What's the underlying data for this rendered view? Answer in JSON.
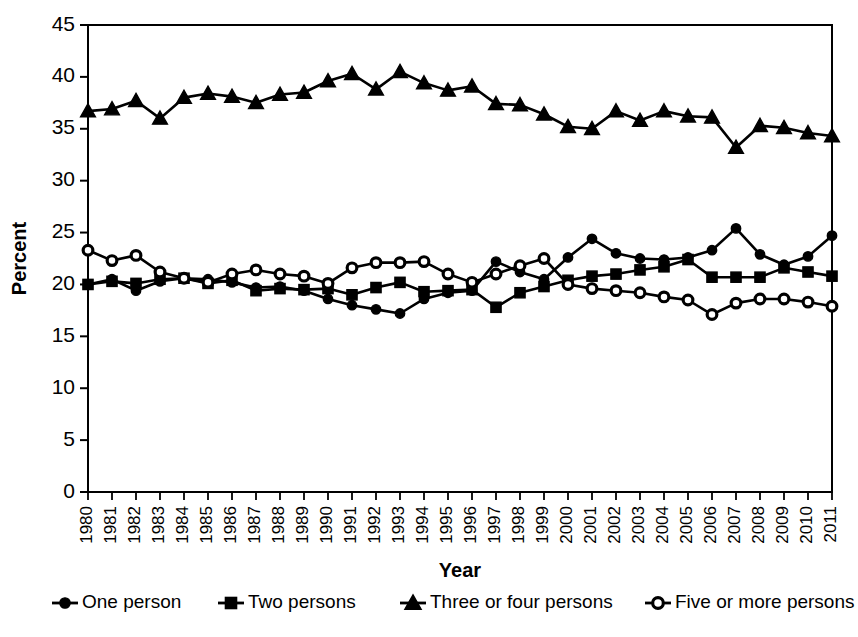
{
  "figure": {
    "background": "#ffffff",
    "ink": "#000000"
  },
  "axes": {
    "xlabel": "Year",
    "ylabel": "Percent",
    "y_ticks": [
      "0",
      "5",
      "10",
      "15",
      "20",
      "25",
      "30",
      "35",
      "40",
      "45"
    ]
  },
  "legend": {
    "items": [
      {
        "label": "One person",
        "marker": "filled-circle"
      },
      {
        "label": "Two persons",
        "marker": "filled-square"
      },
      {
        "label": "Three or four persons",
        "marker": "filled-triangle"
      },
      {
        "label": "Five or more persons",
        "marker": "open-circle"
      }
    ]
  },
  "chart_data": {
    "type": "line",
    "title": "",
    "subtitle": "",
    "xlabel": "Year",
    "ylabel": "Percent",
    "xlim": [
      1980,
      2011
    ],
    "ylim": [
      0,
      45
    ],
    "ytick_interval": 5,
    "grid": false,
    "legend_position": "bottom",
    "x": [
      1980,
      1981,
      1982,
      1983,
      1984,
      1985,
      1986,
      1987,
      1988,
      1989,
      1990,
      1991,
      1992,
      1993,
      1994,
      1995,
      1996,
      1997,
      1998,
      1999,
      2000,
      2001,
      2002,
      2003,
      2004,
      2005,
      2006,
      2007,
      2008,
      2009,
      2010,
      2011
    ],
    "categories": [
      "1980",
      "1981",
      "1982",
      "1983",
      "1984",
      "1985",
      "1986",
      "1987",
      "1988",
      "1989",
      "1990",
      "1991",
      "1992",
      "1993",
      "1994",
      "1995",
      "1996",
      "1997",
      "1998",
      "1999",
      "2000",
      "2001",
      "2002",
      "2003",
      "2004",
      "2005",
      "2006",
      "2007",
      "2008",
      "2009",
      "2010",
      "2011"
    ],
    "series": [
      {
        "name": "One person",
        "marker": "filled-circle",
        "color": "#000000",
        "values": [
          20.0,
          20.5,
          19.4,
          20.3,
          20.6,
          20.5,
          20.2,
          19.7,
          19.8,
          19.4,
          18.6,
          18.0,
          17.6,
          17.2,
          18.6,
          19.2,
          19.4,
          22.2,
          21.2,
          20.5,
          22.6,
          24.4,
          23.0,
          22.5,
          22.4,
          22.6,
          23.3,
          25.4,
          22.9,
          21.9,
          22.7,
          24.7
        ]
      },
      {
        "name": "Two persons",
        "marker": "filled-square",
        "color": "#000000",
        "values": [
          20.0,
          20.3,
          20.1,
          20.5,
          20.6,
          20.1,
          20.4,
          19.4,
          19.6,
          19.5,
          19.6,
          19.0,
          19.7,
          20.2,
          19.3,
          19.4,
          19.5,
          17.8,
          19.2,
          19.8,
          20.4,
          20.8,
          21.0,
          21.4,
          21.7,
          22.4,
          20.7,
          20.7,
          20.7,
          21.6,
          21.2,
          20.8
        ]
      },
      {
        "name": "Three or four persons",
        "marker": "filled-triangle",
        "color": "#000000",
        "values": [
          36.7,
          36.9,
          37.7,
          36.0,
          38.0,
          38.4,
          38.1,
          37.5,
          38.3,
          38.5,
          39.6,
          40.3,
          38.8,
          40.5,
          39.4,
          38.7,
          39.1,
          37.4,
          37.3,
          36.4,
          35.2,
          35.0,
          36.7,
          35.8,
          36.7,
          36.2,
          36.1,
          33.2,
          35.3,
          35.1,
          34.6,
          34.3
        ]
      },
      {
        "name": "Five or more persons",
        "marker": "open-circle",
        "color": "#000000",
        "values": [
          23.3,
          22.3,
          22.8,
          21.2,
          20.6,
          20.2,
          21.0,
          21.4,
          21.0,
          20.8,
          20.1,
          21.6,
          22.1,
          22.1,
          22.2,
          21.0,
          20.2,
          21.0,
          21.8,
          22.5,
          20.0,
          19.6,
          19.4,
          19.2,
          18.8,
          18.5,
          17.1,
          18.2,
          18.6,
          18.6,
          18.3,
          17.9
        ]
      }
    ]
  }
}
